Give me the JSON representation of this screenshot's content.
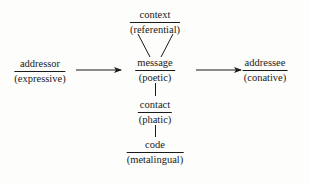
{
  "diagram": {
    "title": "",
    "nodes": {
      "context": {
        "factor": "context",
        "function": "(referential)"
      },
      "addressor": {
        "factor": "addressor",
        "function": "(expressive)"
      },
      "message": {
        "factor": "message",
        "function": "(poetic)"
      },
      "addressee": {
        "factor": "addressee",
        "function": "(conative)"
      },
      "contact": {
        "factor": "contact",
        "function": "(phatic)"
      },
      "code": {
        "factor": "code",
        "function": "(metalingual)"
      }
    },
    "edges": [
      {
        "from": "addressor",
        "to": "message",
        "type": "arrow"
      },
      {
        "from": "message",
        "to": "addressee",
        "type": "arrow"
      },
      {
        "from": "context",
        "to": "message",
        "type": "line-v"
      },
      {
        "from": "message",
        "to": "contact",
        "type": "line"
      },
      {
        "from": "contact",
        "to": "code",
        "type": "line"
      }
    ],
    "colors": {
      "ink": "#1a1a1a",
      "background": "#fdfdfb"
    }
  }
}
